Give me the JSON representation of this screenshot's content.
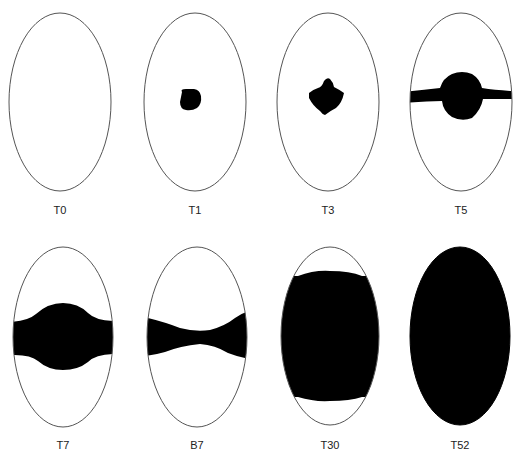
{
  "figure": {
    "colors": {
      "outline": "#555555",
      "fill": "#000000",
      "background": "#ffffff"
    },
    "panels": [
      {
        "label": "T0",
        "stage": "empty"
      },
      {
        "label": "T1",
        "stage": "small central spot"
      },
      {
        "label": "T3",
        "stage": "central lobed spot"
      },
      {
        "label": "T5",
        "stage": "central blob with thin horizontal band"
      },
      {
        "label": "T7",
        "stage": "wide horizontal band with central bulge"
      },
      {
        "label": "B7",
        "stage": "horizontal band, narrow at center-right"
      },
      {
        "label": "T30",
        "stage": "nearly filled, clear caps at poles"
      },
      {
        "label": "T52",
        "stage": "fully filled"
      }
    ]
  }
}
